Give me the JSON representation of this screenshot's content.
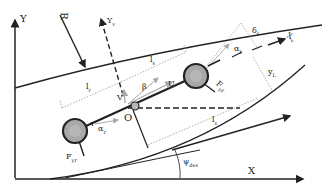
{
  "diagram": {
    "type": "vehicle-bicycle-model",
    "colors": {
      "stroke": "#222222",
      "wheel_fill": "#a8a8a8",
      "dotted": "#777777",
      "light_arrow": "#b0b0b0"
    },
    "labels": {
      "global_y": "Y",
      "global_x": "X",
      "radius": "R",
      "vehicle_y": "Y",
      "vehicle_y_sub": "v",
      "vehicle_x": "X",
      "vehicle_x_sub": "v",
      "lr": "l",
      "lr_sub": "r",
      "lf": "l",
      "lf_sub": "s",
      "ls": "l",
      "ls_sub": "s",
      "v": "V",
      "beta": "β",
      "u": "U",
      "origin": "O",
      "alpha_r": "α",
      "alpha_r_sub": "r",
      "alpha_f": "α",
      "alpha_f_sub": "f",
      "delta_f": "δ",
      "delta_f_sub": "f",
      "yl": "y",
      "yl_sub": "L",
      "fyr": "F",
      "fyr_sub": "yr",
      "fyf": "F",
      "fyf_sub": "yf",
      "psi_des": "ψ",
      "psi_des_sub": "des"
    }
  }
}
